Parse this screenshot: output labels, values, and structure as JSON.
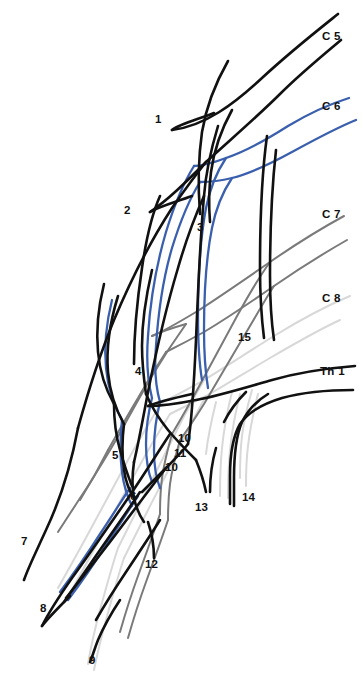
{
  "figure": {
    "background_color": "#ffffff",
    "width": 363,
    "height": 693
  },
  "colors": {
    "black": "#111111",
    "blue": "#3a5fad",
    "gray": "#7a7a7a",
    "light_gray": "#d8d8d8"
  },
  "root_labels": [
    {
      "id": "c5",
      "text": "C 5",
      "color": "#111111",
      "x": 322,
      "y": 31
    },
    {
      "id": "c6",
      "text": "C 6",
      "color": "#3a5fad",
      "x": 322,
      "y": 101
    },
    {
      "id": "c7",
      "text": "C 7",
      "color": "#7a7a7a",
      "x": 322,
      "y": 209
    },
    {
      "id": "c8",
      "text": "C 8",
      "color": "#d8d8d8",
      "x": 322,
      "y": 293
    },
    {
      "id": "th1",
      "text": "Th 1",
      "color": "#111111",
      "x": 320,
      "y": 366
    }
  ],
  "number_labels": [
    {
      "id": "n1",
      "text": "1",
      "x": 155,
      "y": 114
    },
    {
      "id": "n2",
      "text": "2",
      "x": 124,
      "y": 205
    },
    {
      "id": "n3",
      "text": "3",
      "x": 197,
      "y": 222
    },
    {
      "id": "n4",
      "text": "4",
      "x": 135,
      "y": 366
    },
    {
      "id": "n5",
      "text": "5",
      "x": 112,
      "y": 450
    },
    {
      "id": "n6",
      "text": "6",
      "x": 130,
      "y": 491
    },
    {
      "id": "n7",
      "text": "7",
      "x": 21,
      "y": 536
    },
    {
      "id": "n8",
      "text": "8",
      "x": 40,
      "y": 603
    },
    {
      "id": "n9",
      "text": "9",
      "x": 89,
      "y": 655
    },
    {
      "id": "n10a",
      "text": "10",
      "x": 178,
      "y": 433
    },
    {
      "id": "n11",
      "text": "11",
      "x": 174,
      "y": 448
    },
    {
      "id": "n10b",
      "text": "10",
      "x": 165,
      "y": 462
    },
    {
      "id": "n12",
      "text": "12",
      "x": 145,
      "y": 559
    },
    {
      "id": "n13",
      "text": "13",
      "x": 195,
      "y": 502
    },
    {
      "id": "n14",
      "text": "14",
      "x": 242,
      "y": 492
    },
    {
      "id": "n15",
      "text": "15",
      "x": 238,
      "y": 332
    }
  ],
  "paths": {
    "black": [
      "M 338 14 C 318 30, 290 52, 262 78 C 234 104, 205 126, 172 130",
      "M 172 130 C 180 124, 196 120, 214 113",
      "M 341 40 C 322 56, 300 74, 280 94 C 258 116, 230 140, 206 162 C 186 182, 168 200, 150 212",
      "M 150 212 C 160 206, 176 202, 192 196",
      "M 206 162 C 198 172, 186 188, 172 208 C 150 242, 130 282, 114 320 C 100 354, 88 392, 78 428",
      "M 78 428 C 72 460, 62 496, 46 530 C 36 552, 28 568, 24 580",
      "M 228 61 C 216 82, 206 108, 202 132 C 198 160, 198 188, 200 214",
      "M 232 110 C 222 128, 214 150, 211 172 C 208 196, 209 210, 210 222",
      "M 218 126 C 212 146, 206 170, 204 196 C 200 240, 198 290, 196 340 C 194 384, 192 420, 188 444",
      "M 204 196 C 196 214, 186 240, 178 268 C 166 308, 156 352, 148 392 C 142 424, 138 446, 134 462",
      "M 160 196 C 152 214, 146 240, 142 268 C 136 308, 134 340, 134 364",
      "M 152 270 C 146 296, 142 322, 142 346 C 142 366, 144 380, 146 394",
      "M 104 284 C 98 308, 96 330, 98 352 C 100 374, 106 390, 114 404",
      "M 118 296 C 110 322, 106 348, 108 372 C 110 394, 116 410, 124 424",
      "M 267 136 C 262 172, 260 222, 260 268 C 260 302, 262 322, 264 338",
      "M 276 150 C 272 186, 270 232, 270 276 C 270 308, 272 326, 274 340",
      "M 146 394 C 152 408, 160 420, 168 430 C 178 442, 188 452, 196 460",
      "M 188 444 C 182 452, 174 460, 166 468 C 156 478, 148 486, 142 492",
      "M 134 462 C 132 476, 132 488, 134 498 C 136 508, 140 516, 144 522",
      "M 124 424 C 122 440, 122 456, 124 470 C 126 484, 130 492, 134 498",
      "M 114 404 C 114 420, 116 436, 120 450 C 124 464, 128 476, 132 486",
      "M 355 366 C 330 368, 300 372, 272 380 C 244 388, 218 396, 196 400 C 176 404, 160 406, 148 406",
      "M 148 406 C 158 402, 174 398, 192 394",
      "M 353 390 C 330 390, 304 392, 282 398 C 262 404, 248 412, 240 424 C 232 438, 230 456, 230 476 C 230 488, 230 496, 230 504",
      "M 268 394 C 258 400, 248 410, 242 422 C 236 436, 234 456, 234 478 C 234 490, 234 498, 234 506",
      "M 246 392 C 238 400, 230 410, 224 422",
      "M 196 460 C 200 470, 204 482, 206 492",
      "M 216 448 C 212 462, 210 478, 210 492",
      "M 170 434 C 158 452, 142 478, 124 504 C 106 530, 88 556, 72 578 C 58 598, 48 614, 42 626",
      "M 42 626 C 48 618, 58 608, 70 596",
      "M 166 468 C 152 486, 134 510, 116 534 C 98 558, 80 580, 66 598",
      "M 140 492 C 128 510, 114 530, 100 550 C 86 570, 74 588, 64 602",
      "M 120 600 C 112 612, 104 626, 98 640 C 94 650, 92 658, 90 662",
      "M 160 520 C 150 536, 138 554, 126 572 C 114 590, 104 606, 96 620",
      "M 148 522 C 152 534, 154 548, 154 558"
    ],
    "blue": [
      "M 349 98 C 330 104, 308 114, 288 126 C 266 140, 244 152, 226 158 C 210 164, 200 166, 194 166",
      "M 356 120 C 336 128, 314 140, 292 152 C 270 164, 248 174, 232 178 C 216 182, 206 182, 200 182",
      "M 226 158 C 218 170, 210 188, 206 208 C 200 240, 198 280, 198 316 C 198 348, 200 368, 202 380",
      "M 232 178 C 224 190, 216 208, 212 228 C 206 258, 204 296, 204 330 C 204 360, 206 376, 208 388",
      "M 194 166 C 184 182, 174 206, 166 232 C 156 266, 150 304, 148 336 C 146 362, 148 382, 152 398",
      "M 200 182 C 190 198, 180 222, 172 248 C 162 282, 158 316, 156 346 C 154 370, 156 388, 160 402",
      "M 152 398 C 148 414, 146 430, 146 444 C 146 460, 148 472, 152 482",
      "M 160 402 C 156 418, 154 434, 154 450 C 154 466, 156 478, 160 488",
      "M 112 300 C 106 324, 104 346, 106 368 C 108 390, 114 406, 122 420",
      "M 122 420 C 120 438, 120 456, 122 472 C 124 488, 128 498, 132 506",
      "M 130 488 C 122 500, 112 516, 100 534 C 86 556, 72 576, 60 592",
      "M 138 496 C 130 508, 120 524, 108 542 C 94 564, 80 584, 68 600"
    ],
    "gray": [
      "M 344 216 C 322 228, 296 244, 270 262 C 244 280, 218 298, 196 312 C 176 324, 162 332, 152 336",
      "M 152 336 C 160 332, 172 328, 186 324",
      "M 347 240 C 326 252, 300 268, 274 286 C 248 304, 224 320, 204 332 C 186 342, 174 348, 166 352",
      "M 270 262 C 260 276, 248 296, 236 318 C 222 344, 208 370, 196 392 C 186 410, 178 424, 172 434",
      "M 274 286 C 266 298, 256 316, 244 336 C 230 360, 216 384, 204 404 C 194 420, 186 432, 180 440",
      "M 186 324 C 176 338, 164 356, 152 376 C 138 400, 126 422, 116 440",
      "M 166 352 C 158 364, 148 380, 138 398 C 126 418, 116 436, 108 450",
      "M 172 434 C 168 448, 164 464, 162 478 C 160 494, 160 506, 160 514",
      "M 180 440 C 176 454, 172 470, 170 484 C 168 500, 168 512, 168 520",
      "M 116 440 C 108 454, 98 470, 88 486 C 76 504, 66 520, 58 532",
      "M 160 514 C 154 532, 146 554, 138 576 C 130 598, 124 618, 120 632",
      "M 168 520 C 162 538, 154 560, 146 582 C 138 604, 132 624, 128 638",
      "M 108 450 C 100 466, 90 484, 80 500"
    ],
    "light_gray": [
      "M 350 296 C 326 306, 300 320, 274 336 C 248 352, 224 368, 204 380 C 186 390, 172 398, 162 402",
      "M 340 320 C 318 330, 294 344, 270 358 C 246 372, 224 386, 206 396 C 190 404, 178 410, 170 414",
      "M 204 380 C 196 394, 186 412, 176 432 C 164 456, 152 480, 142 500 C 132 520, 124 536, 118 548",
      "M 206 396 C 198 410, 190 426, 180 446 C 170 468, 158 490, 148 510 C 138 530, 130 546, 124 558",
      "M 162 402 C 152 418, 140 438, 128 460 C 114 486, 100 512, 88 534 C 76 556, 66 574, 58 588",
      "M 170 414 C 160 430, 148 450, 136 472 C 122 498, 108 524, 96 546 C 84 568, 74 586, 66 600",
      "M 118 548 C 112 566, 106 588, 100 610 C 94 632, 90 652, 88 664",
      "M 124 558 C 118 576, 112 598, 106 620 C 100 642, 96 660, 94 670",
      "M 232 392 C 228 408, 224 428, 222 448 C 220 468, 220 484, 220 496",
      "M 240 394 C 236 410, 232 430, 230 450 C 228 470, 228 486, 228 498",
      "M 216 402 C 212 418, 208 436, 206 454",
      "M 252 390 C 248 404, 244 420, 242 436 C 240 452, 240 466, 240 478",
      "M 258 394 C 254 410, 250 428, 248 446 C 246 462, 246 476, 246 486"
    ]
  }
}
